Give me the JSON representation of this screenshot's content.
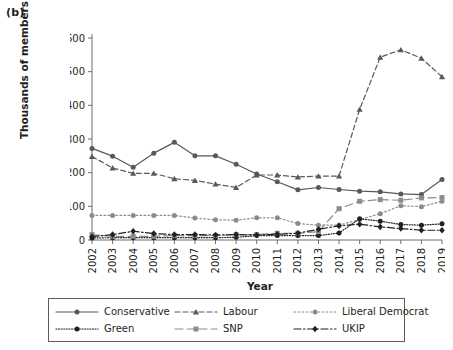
{
  "panel_label": "(b)",
  "axis": {
    "ylabel": "Thousands of members",
    "xlabel": "Year"
  },
  "legend": {
    "rows": [
      [
        {
          "name": "Conservative",
          "key": "conservative"
        },
        {
          "name": "Labour",
          "key": "labour"
        },
        {
          "name": "Liberal Democrat",
          "key": "libdem"
        }
      ],
      [
        {
          "name": "Green",
          "key": "green"
        },
        {
          "name": "SNP",
          "key": "snp"
        },
        {
          "name": "UKIP",
          "key": "ukip"
        }
      ]
    ]
  },
  "chart_data": {
    "type": "line",
    "title": "(b)",
    "xlabel": "Year",
    "ylabel": "Thousands of members",
    "xlim": [
      2002,
      2019
    ],
    "ylim": [
      0,
      600
    ],
    "yticks": [
      0,
      100,
      200,
      300,
      400,
      500,
      600
    ],
    "grid": false,
    "legend_position": "below",
    "categories": [
      2002,
      2003,
      2004,
      2005,
      2006,
      2007,
      2008,
      2009,
      2010,
      2011,
      2012,
      2013,
      2014,
      2015,
      2016,
      2017,
      2018,
      2019
    ],
    "xtick_labels": [
      "2002",
      "2003",
      "2004",
      "2005",
      "2006",
      "2007",
      "2008",
      "2009",
      "2010",
      "2011",
      "2012",
      "2013",
      "2014",
      "2015",
      "2016",
      "2017",
      "2018",
      "2019"
    ],
    "series": [
      {
        "name": "Conservative",
        "key": "conservative",
        "color": "#595959",
        "line_style": "solid",
        "marker": "circle",
        "values": [
          272,
          249,
          216,
          258,
          290,
          250,
          250,
          225,
          196,
          173,
          149,
          156,
          150,
          145,
          143,
          137,
          135,
          180
        ]
      },
      {
        "name": "Labour",
        "key": "labour",
        "color": "#595959",
        "line_style": "dashed",
        "marker": "triangle",
        "values": [
          248,
          214,
          198,
          198,
          182,
          177,
          166,
          156,
          193,
          193,
          187,
          190,
          190,
          388,
          543,
          565,
          540,
          485
        ]
      },
      {
        "name": "Liberal Democrat",
        "key": "libdem",
        "color": "#8c8c8c",
        "line_style": "dotted",
        "marker": "circle",
        "values": [
          73,
          73,
          73,
          73,
          73,
          65,
          60,
          59,
          66,
          66,
          49,
          44,
          44,
          61,
          78,
          102,
          99,
          115
        ]
      },
      {
        "name": "Green",
        "key": "green",
        "color": "#231f20",
        "line_style": "fine-dotted",
        "marker": "filled-circle",
        "values": [
          6,
          7,
          7,
          7,
          7,
          7,
          7,
          8,
          13,
          13,
          13,
          13,
          21,
          63,
          56,
          46,
          44,
          48
        ]
      },
      {
        "name": "SNP",
        "key": "snp",
        "color": "#8c8c8c",
        "line_style": "long-dash",
        "marker": "square",
        "values": [
          16,
          11,
          11,
          11,
          13,
          13,
          13,
          16,
          16,
          20,
          20,
          25,
          93,
          115,
          120,
          118,
          125,
          126
        ]
      },
      {
        "name": "UKIP",
        "key": "ukip",
        "color": "#231f20",
        "line_style": "dash-dot",
        "marker": "diamond",
        "values": [
          10,
          16,
          26,
          19,
          16,
          16,
          15,
          16,
          15,
          17,
          20,
          32,
          42,
          47,
          39,
          34,
          29,
          29
        ]
      }
    ]
  }
}
